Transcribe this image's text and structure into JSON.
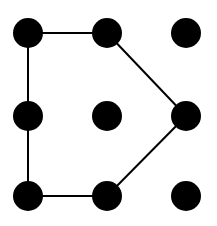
{
  "diagram": {
    "type": "dot-grid-pattern",
    "grid": {
      "rows": 3,
      "cols": 3
    },
    "colors": {
      "background": "#ffffff",
      "dot": "#000000",
      "line": "#000000"
    },
    "dots": [
      {
        "id": "r0c0",
        "row": 0,
        "col": 0,
        "cx": 28,
        "cy": 33
      },
      {
        "id": "r0c1",
        "row": 0,
        "col": 1,
        "cx": 107,
        "cy": 33
      },
      {
        "id": "r0c2",
        "row": 0,
        "col": 2,
        "cx": 186,
        "cy": 33
      },
      {
        "id": "r1c0",
        "row": 1,
        "col": 0,
        "cx": 28,
        "cy": 116
      },
      {
        "id": "r1c1",
        "row": 1,
        "col": 1,
        "cx": 107,
        "cy": 116
      },
      {
        "id": "r1c2",
        "row": 1,
        "col": 2,
        "cx": 186,
        "cy": 116
      },
      {
        "id": "r2c0",
        "row": 2,
        "col": 0,
        "cx": 28,
        "cy": 196
      },
      {
        "id": "r2c1",
        "row": 2,
        "col": 1,
        "cx": 107,
        "cy": 196
      },
      {
        "id": "r2c2",
        "row": 2,
        "col": 2,
        "cx": 186,
        "cy": 196
      }
    ],
    "dot_radius": 15,
    "path": [
      "r0c0",
      "r0c1",
      "r1c2",
      "r2c1",
      "r2c0",
      "r1c0",
      "r0c0"
    ],
    "line_width": 2
  }
}
